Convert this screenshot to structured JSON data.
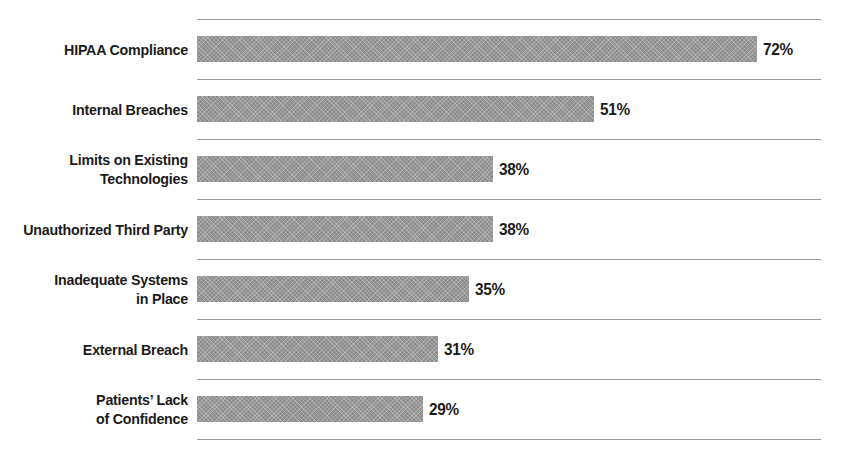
{
  "chart_data": {
    "type": "bar",
    "orientation": "horizontal",
    "title": "",
    "subtitle": "",
    "xlabel": "",
    "ylabel": "",
    "xlim": [
      0,
      80
    ],
    "grid": true,
    "legend": false,
    "value_suffix": "%",
    "categories": [
      "HIPAA Compliance",
      "Internal Breaches",
      "Limits on Existing Technologies",
      "Unauthorized Third Party",
      "Inadequate Systems in Place",
      "External Breach",
      "Patients’ Lack of Confidence"
    ],
    "values": [
      72,
      51,
      38,
      38,
      35,
      31,
      29
    ],
    "value_labels": [
      "72%",
      "51%",
      "38%",
      "38%",
      "35%",
      "31%",
      "29%"
    ],
    "colors": {
      "bar_fill": "#8c8c8c",
      "gridline": "#9a9a9a",
      "text": "#1b1b1b",
      "background": "#ffffff"
    }
  },
  "rows": [
    {
      "label_lines": [
        "HIPAA Compliance"
      ],
      "value": 72,
      "value_label": "72%"
    },
    {
      "label_lines": [
        "Internal Breaches"
      ],
      "value": 51,
      "value_label": "51%"
    },
    {
      "label_lines": [
        "Limits on Existing",
        "Technologies"
      ],
      "value": 38,
      "value_label": "38%"
    },
    {
      "label_lines": [
        "Unauthorized Third Party"
      ],
      "value": 38,
      "value_label": "38%"
    },
    {
      "label_lines": [
        "Inadequate Systems",
        "in Place"
      ],
      "value": 35,
      "value_label": "35%"
    },
    {
      "label_lines": [
        "External Breach"
      ],
      "value": 31,
      "value_label": "31%"
    },
    {
      "label_lines": [
        "Patients’ Lack",
        "of Confidence"
      ],
      "value": 29,
      "value_label": "29%"
    }
  ],
  "layout": {
    "plot_left": 197,
    "plot_right": 821,
    "first_gridline_y": 19,
    "row_pitch": 60,
    "px_per_unit": 7.78,
    "bar_height": 26,
    "bar_offset_in_row": 17,
    "value_gap": 6
  }
}
